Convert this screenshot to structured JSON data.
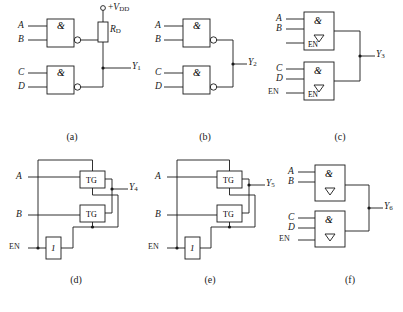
{
  "figure": {
    "title": "",
    "type": "logic-gate-schematic-set",
    "panels": [
      {
        "id": "a",
        "caption": "(a)",
        "inputs": [
          "A",
          "B",
          "C",
          "D"
        ],
        "output": "Y1",
        "output_label": "Y",
        "output_sub": "1",
        "supply": "+VDD",
        "supply_label": "+V",
        "supply_sub": "DD",
        "resistor": "RD",
        "resistor_label": "R",
        "resistor_sub": "D",
        "gates": [
          {
            "symbol": "&",
            "qualifier": "open-drain",
            "inputs": [
              "A",
              "B"
            ]
          },
          {
            "symbol": "&",
            "qualifier": "open-drain",
            "inputs": [
              "C",
              "D"
            ]
          }
        ]
      },
      {
        "id": "b",
        "caption": "(b)",
        "inputs": [
          "A",
          "B",
          "C",
          "D"
        ],
        "output": "Y2",
        "output_label": "Y",
        "output_sub": "2",
        "gates": [
          {
            "symbol": "&",
            "inputs": [
              "A",
              "B"
            ]
          },
          {
            "symbol": "&",
            "inputs": [
              "C",
              "D"
            ]
          }
        ]
      },
      {
        "id": "c",
        "caption": "(c)",
        "inputs": [
          "A",
          "B",
          "C",
          "D",
          "EN"
        ],
        "output": "Y3",
        "output_label": "Y",
        "output_sub": "3",
        "gates": [
          {
            "symbol": "&",
            "qualifier": "three-state",
            "inputs": [
              "A",
              "B"
            ],
            "enable": "EN"
          },
          {
            "symbol": "&",
            "qualifier": "three-state",
            "inputs": [
              "C",
              "D"
            ],
            "enable": "EN"
          }
        ]
      },
      {
        "id": "d",
        "caption": "(d)",
        "inputs": [
          "A",
          "B",
          "EN"
        ],
        "output": "Y4",
        "output_label": "Y",
        "output_sub": "4",
        "gates": [
          {
            "symbol": "TG"
          },
          {
            "symbol": "TG"
          },
          {
            "symbol": "1"
          }
        ]
      },
      {
        "id": "e",
        "caption": "(e)",
        "inputs": [
          "A",
          "B",
          "EN"
        ],
        "output": "Y5",
        "output_label": "Y",
        "output_sub": "5",
        "gates": [
          {
            "symbol": "TG"
          },
          {
            "symbol": "TG"
          },
          {
            "symbol": "1"
          }
        ]
      },
      {
        "id": "f",
        "caption": "(f)",
        "inputs": [
          "A",
          "B",
          "C",
          "D",
          "EN"
        ],
        "output": "Y6",
        "output_label": "Y",
        "output_sub": "6",
        "gates": [
          {
            "symbol": "&",
            "qualifier": "three-state",
            "inputs": [
              "A",
              "B"
            ]
          },
          {
            "symbol": "&",
            "qualifier": "three-state",
            "inputs": [
              "C",
              "D"
            ],
            "enable": "EN"
          }
        ]
      }
    ],
    "symbols": {
      "and": "&",
      "buffer": "1",
      "transmission_gate": "TG",
      "enable": "EN",
      "three_state": "▽"
    },
    "colors": {
      "line": "#1a1a1a",
      "background": "#ffffff"
    }
  }
}
